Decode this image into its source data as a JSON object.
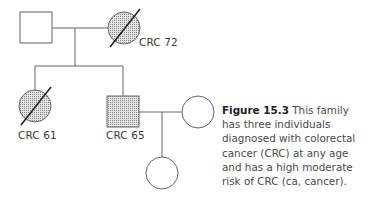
{
  "figure": {
    "label": "Figure 15.3",
    "caption": " This family has three individuals diagnosed with colorectal cancer (CRC) at any age and has a high moderate risk of CRC (ca, cancer)."
  },
  "pedigree": {
    "individuals": [
      {
        "id": "I-1",
        "sex": "male",
        "affected": false,
        "deceased": false,
        "label": ""
      },
      {
        "id": "I-2",
        "sex": "female",
        "affected": true,
        "deceased": true,
        "label": "CRC 72"
      },
      {
        "id": "II-1",
        "sex": "female",
        "affected": true,
        "deceased": true,
        "label": "CRC 61"
      },
      {
        "id": "II-2",
        "sex": "male",
        "affected": true,
        "deceased": false,
        "label": "CRC 65"
      },
      {
        "id": "II-3",
        "sex": "female",
        "affected": false,
        "deceased": false,
        "label": ""
      },
      {
        "id": "III-1",
        "sex": "female",
        "affected": false,
        "deceased": false,
        "label": ""
      }
    ],
    "colors": {
      "line": "#555555",
      "fill_pattern": "#9a9a9a",
      "background": "#ffffff"
    }
  }
}
